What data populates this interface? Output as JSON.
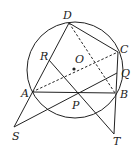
{
  "diagram": {
    "type": "geometry",
    "circle": {
      "center": "O",
      "cx": 75,
      "cy": 70,
      "r": 48
    },
    "points": {
      "D": {
        "x": 69,
        "y": 23,
        "label": "D",
        "lx": 63,
        "ly": 19
      },
      "C": {
        "x": 118,
        "y": 52,
        "label": "C",
        "lx": 120,
        "ly": 53
      },
      "Q": {
        "x": 117,
        "y": 73,
        "label": "Q",
        "lx": 121,
        "ly": 77
      },
      "B": {
        "x": 115,
        "y": 93,
        "label": "B",
        "lx": 120,
        "ly": 98
      },
      "A": {
        "x": 32,
        "y": 92,
        "label": "A",
        "lx": 21,
        "ly": 97
      },
      "P": {
        "x": 78,
        "y": 93,
        "label": "P",
        "lx": 72,
        "ly": 109
      },
      "R": {
        "x": 49,
        "y": 60,
        "label": "R",
        "lx": 40,
        "ly": 60
      },
      "O": {
        "x": 74,
        "y": 69,
        "label": "O",
        "lx": 75,
        "ly": 63
      },
      "S": {
        "x": 14,
        "y": 127,
        "label": "S",
        "lx": 12,
        "ly": 140
      },
      "T": {
        "x": 114,
        "y": 134,
        "label": "T",
        "lx": 113,
        "ly": 145
      }
    },
    "solid_segments": [
      [
        "D",
        "C"
      ],
      [
        "D",
        "S"
      ],
      [
        "A",
        "B"
      ],
      [
        "R",
        "T"
      ],
      [
        "S",
        "Q"
      ],
      [
        "C",
        "T"
      ]
    ],
    "dashed_segments": [
      [
        "D",
        "B"
      ],
      [
        "A",
        "C"
      ]
    ]
  }
}
